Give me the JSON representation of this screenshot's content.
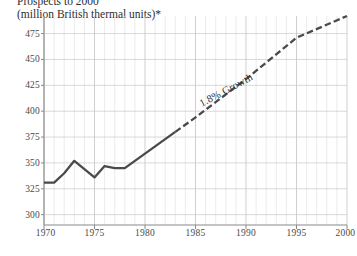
{
  "title": {
    "line1": "Prospects to 2000",
    "line2": "(million British thermal units)*"
  },
  "chart_data": {
    "type": "line",
    "title": "(million British thermal units)*",
    "xlabel": "",
    "ylabel": "",
    "xlim": [
      1970,
      2000
    ],
    "ylim": [
      290,
      492
    ],
    "grid": true,
    "legend": false,
    "xticks": [
      "1970",
      "1975",
      "1980",
      "1985",
      "1990",
      "1995",
      "2000"
    ],
    "xtick_values": [
      1970,
      1975,
      1980,
      1985,
      1990,
      1995,
      2000
    ],
    "yticks": [
      "300",
      "325",
      "350",
      "375",
      "400",
      "425",
      "450",
      "475"
    ],
    "ytick_values": [
      300,
      325,
      350,
      375,
      400,
      425,
      450,
      475
    ],
    "minor_xgrid_step": 1,
    "series": [
      {
        "name": "Historical",
        "style": "solid",
        "color": "#4a4a4a",
        "x": [
          1970,
          1971,
          1972,
          1973,
          1974,
          1975,
          1976,
          1977,
          1978,
          1979,
          1980,
          1981,
          1982,
          1983
        ],
        "values": [
          331,
          331,
          340,
          352,
          344,
          336,
          347,
          345,
          345,
          352,
          359,
          366,
          373,
          380
        ]
      },
      {
        "name": "Projection",
        "style": "dashed",
        "color": "#4a4a4a",
        "x": [
          1983,
          1985,
          1990,
          1995,
          2000
        ],
        "values": [
          380,
          394,
          431,
          471,
          492
        ]
      }
    ],
    "annotations": [
      {
        "text": "1.8% Growth",
        "x": 1988,
        "y": 420,
        "rotation": -28
      }
    ]
  },
  "axis": {
    "y_tick_labels": [
      "475",
      "450",
      "425",
      "400",
      "375",
      "350",
      "325",
      "300"
    ],
    "x_tick_labels": [
      "1970",
      "1975",
      "1980",
      "1985",
      "1990",
      "1995",
      "2000"
    ]
  },
  "colors": {
    "line": "#4a4a4a",
    "grid_minor": "#e3e3e3",
    "grid_major": "#c9c9c9",
    "axis": "#8a8a8a",
    "text": "#3a3a3a"
  }
}
